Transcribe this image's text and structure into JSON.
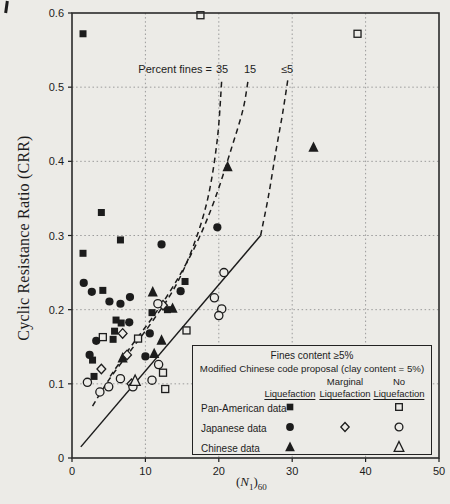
{
  "colors": {
    "ink": "#1c1c1c",
    "paper": "#ecebe7",
    "grid": "#9b9b9b",
    "border": "#2b2b2b"
  },
  "annotations": {
    "percent_fines": "Percent fines =",
    "curve_labels": [
      {
        "label": "35"
      },
      {
        "label": "15"
      },
      {
        "label": "≤5"
      }
    ]
  },
  "axes": {
    "ylabel": "Cyclic Resistance Ratio (CRR)",
    "xlabel_parts": {
      "open": "(",
      "symbol": "N",
      "sub1": "1",
      "close": ")",
      "sub2": "60"
    },
    "x_ticks": [
      {
        "value": 0,
        "label": "0"
      },
      {
        "value": 10,
        "label": "10"
      },
      {
        "value": 20,
        "label": "20"
      },
      {
        "value": 30,
        "label": "30"
      },
      {
        "value": 40,
        "label": "40"
      },
      {
        "value": 50,
        "label": "50"
      }
    ],
    "y_ticks": [
      {
        "value": 0,
        "label": "0"
      },
      {
        "value": 0.1,
        "label": "0.1"
      },
      {
        "value": 0.2,
        "label": "0.2"
      },
      {
        "value": 0.3,
        "label": "0.3"
      },
      {
        "value": 0.4,
        "label": "0.4"
      },
      {
        "value": 0.5,
        "label": "0.5"
      },
      {
        "value": 0.6,
        "label": "0.6"
      }
    ]
  },
  "legend": {
    "title_line1": "Fines content ≥5%",
    "title_line2": "Modified Chinese code proposal (clay content = 5%)",
    "columns": [
      {
        "top": "",
        "bottom": "Liquefaction"
      },
      {
        "top": "Marginal",
        "bottom": "Liquefaction"
      },
      {
        "top": "No",
        "bottom": "Liquefaction"
      }
    ],
    "rows": [
      {
        "label": "Pan-American data",
        "liquefaction": "filled-square",
        "marginal": null,
        "no_liquefaction": "open-square"
      },
      {
        "label": "Japanese data",
        "liquefaction": "filled-circle",
        "marginal": "open-diamond",
        "no_liquefaction": "open-circle"
      },
      {
        "label": "Chinese data",
        "liquefaction": "filled-triangle",
        "marginal": null,
        "no_liquefaction": "open-triangle"
      }
    ]
  },
  "chart_data": {
    "type": "scatter",
    "xlabel": "(N1)60",
    "ylabel": "Cyclic Resistance Ratio (CRR)",
    "xlim": [
      0,
      50
    ],
    "ylim": [
      0,
      0.6
    ],
    "grid": true,
    "series": [
      {
        "name": "Pan-American data — Liquefaction",
        "marker": "filled-square",
        "points": [
          [
            1.5,
            0.572
          ],
          [
            4.0,
            0.331
          ],
          [
            6.6,
            0.294
          ],
          [
            1.5,
            0.276
          ],
          [
            4.2,
            0.226
          ],
          [
            15.4,
            0.238
          ],
          [
            10.9,
            0.196
          ],
          [
            13.0,
            0.2
          ],
          [
            6.0,
            0.186
          ],
          [
            6.7,
            0.182
          ],
          [
            5.8,
            0.171
          ],
          [
            5.6,
            0.16
          ],
          [
            2.8,
            0.132
          ],
          [
            3.0,
            0.11
          ]
        ]
      },
      {
        "name": "Japanese data — Liquefaction",
        "marker": "filled-circle",
        "points": [
          [
            12.2,
            0.288
          ],
          [
            1.6,
            0.236
          ],
          [
            2.7,
            0.224
          ],
          [
            5.1,
            0.211
          ],
          [
            6.6,
            0.208
          ],
          [
            7.9,
            0.217
          ],
          [
            14.8,
            0.225
          ],
          [
            19.8,
            0.311
          ],
          [
            7.8,
            0.183
          ],
          [
            3.3,
            0.158
          ],
          [
            10.6,
            0.168
          ],
          [
            2.4,
            0.139
          ],
          [
            10.0,
            0.137
          ]
        ]
      },
      {
        "name": "Chinese data — Liquefaction",
        "marker": "filled-triangle",
        "points": [
          [
            21.2,
            0.393
          ],
          [
            32.9,
            0.419
          ],
          [
            11.0,
            0.224
          ],
          [
            13.7,
            0.202
          ],
          [
            12.2,
            0.159
          ],
          [
            11.2,
            0.141
          ],
          [
            6.9,
            0.135
          ]
        ]
      },
      {
        "name": "Pan-American data — No Liquefaction",
        "marker": "open-square",
        "points": [
          [
            17.5,
            0.597
          ],
          [
            38.9,
            0.572
          ],
          [
            15.6,
            0.172
          ],
          [
            4.2,
            0.163
          ],
          [
            9.0,
            0.161
          ],
          [
            12.4,
            0.115
          ],
          [
            12.7,
            0.093
          ]
        ]
      },
      {
        "name": "Japanese data — Marginal Liquefaction",
        "marker": "open-diamond",
        "points": [
          [
            6.9,
            0.168
          ],
          [
            7.5,
            0.139
          ],
          [
            4.0,
            0.12
          ],
          [
            8.1,
            0.1
          ],
          [
            12.4,
            0.206
          ]
        ]
      },
      {
        "name": "Japanese data — No Liquefaction",
        "marker": "open-circle",
        "points": [
          [
            20.7,
            0.25
          ],
          [
            19.4,
            0.216
          ],
          [
            20.4,
            0.201
          ],
          [
            20.0,
            0.192
          ],
          [
            11.7,
            0.208
          ],
          [
            11.8,
            0.126
          ],
          [
            10.9,
            0.105
          ],
          [
            2.1,
            0.102
          ],
          [
            3.8,
            0.089
          ],
          [
            5.0,
            0.096
          ],
          [
            6.6,
            0.107
          ],
          [
            8.3,
            0.096
          ]
        ]
      },
      {
        "name": "Chinese data — No Liquefaction",
        "marker": "open-triangle",
        "points": [
          [
            8.6,
            0.104
          ]
        ]
      }
    ],
    "curves": [
      {
        "name": "percent-fines-35-curve",
        "style": "dashed",
        "label": "35",
        "points": [
          [
            2.8,
            0.07
          ],
          [
            5.0,
            0.105
          ],
          [
            8.0,
            0.145
          ],
          [
            11.0,
            0.185
          ],
          [
            14.0,
            0.23
          ],
          [
            16.5,
            0.285
          ],
          [
            18.5,
            0.35
          ],
          [
            19.8,
            0.43
          ],
          [
            20.4,
            0.51
          ]
        ]
      },
      {
        "name": "percent-fines-15-curve",
        "style": "dashed",
        "label": "15",
        "points": [
          [
            5.2,
            0.11
          ],
          [
            8.0,
            0.15
          ],
          [
            11.0,
            0.19
          ],
          [
            14.0,
            0.235
          ],
          [
            17.0,
            0.29
          ],
          [
            19.5,
            0.35
          ],
          [
            21.8,
            0.42
          ],
          [
            23.3,
            0.47
          ],
          [
            24.0,
            0.51
          ]
        ]
      },
      {
        "name": "percent-fines-le5-curve",
        "style": "dashed",
        "label": "≤5",
        "points": [
          [
            25.7,
            0.3
          ],
          [
            26.8,
            0.355
          ],
          [
            27.8,
            0.415
          ],
          [
            28.7,
            0.465
          ],
          [
            29.4,
            0.51
          ]
        ]
      },
      {
        "name": "modified-chinese-code-line",
        "style": "solid",
        "points": [
          [
            1.2,
            0.015
          ],
          [
            25.7,
            0.3
          ]
        ]
      }
    ]
  }
}
